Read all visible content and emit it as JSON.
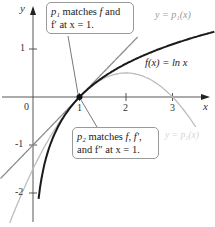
{
  "figure": {
    "axes": {
      "x_label": "x",
      "y_label": "y",
      "origin_label": "0",
      "x_ticks": [
        "1",
        "2",
        "3"
      ],
      "y_ticks": [
        "1",
        "-1",
        "-2"
      ]
    },
    "curves": [
      {
        "name": "f",
        "label": "f(x) = ln x",
        "color": "#1a1a1a"
      },
      {
        "name": "p1",
        "label": "y = p₁(x)",
        "color": "#8c8c8c"
      },
      {
        "name": "p2",
        "label": "y = p₂(x)",
        "color": "#bdbdbd"
      }
    ],
    "callouts": [
      {
        "line1_sym": "p₁",
        "line1_text": " matches ",
        "line1_f": "f",
        "line1_end": " and",
        "line2": "f′ at x = 1."
      },
      {
        "line1_sym": "p₂",
        "line1_text": " matches ",
        "line1_f": "f, f′,",
        "line2": "and  f″ at x = 1."
      }
    ],
    "point": {
      "x": 1,
      "y": 0
    }
  },
  "chart_data": {
    "type": "line",
    "title": "",
    "xlabel": "x",
    "ylabel": "y",
    "xlim": [
      -0.7,
      3.9
    ],
    "ylim": [
      -2.6,
      1.95
    ],
    "grid": false,
    "series": [
      {
        "name": "f(x) = ln x",
        "expr": "ln(x)",
        "domain": [
          0.12,
          3.9
        ]
      },
      {
        "name": "y = p1(x)",
        "expr": "x - 1",
        "domain": [
          -0.7,
          2.25
        ]
      },
      {
        "name": "y = p2(x)",
        "expr": "(x-1) - (x-1)^2/2",
        "domain": [
          -0.5,
          3.5
        ]
      }
    ],
    "annotations": [
      "p1 matches f and f' at x = 1.",
      "p2 matches f, f', and f'' at x = 1."
    ],
    "marked_point": [
      1,
      0
    ]
  }
}
